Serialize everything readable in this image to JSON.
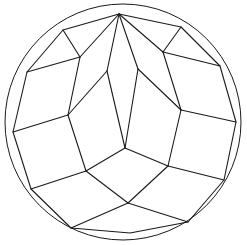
{
  "figure": {
    "stroke_color": "#1a1a1a",
    "background": "#ffffff",
    "circle": {
      "cx": 123,
      "cy": 122,
      "r": 118
    },
    "outer_polygon": [
      [
        119,
        14
      ],
      [
        181,
        27
      ],
      [
        220,
        66
      ],
      [
        236,
        122
      ],
      [
        224,
        180
      ],
      [
        188,
        222
      ],
      [
        130,
        233
      ],
      [
        71,
        228
      ],
      [
        31,
        189
      ],
      [
        13,
        132
      ],
      [
        27,
        72
      ],
      [
        63,
        30
      ]
    ],
    "inner_edges": [
      [
        [
          119,
          14
        ],
        [
          80,
          57
        ]
      ],
      [
        [
          119,
          14
        ],
        [
          107,
          71
        ]
      ],
      [
        [
          119,
          14
        ],
        [
          138,
          69
        ]
      ],
      [
        [
          119,
          14
        ],
        [
          163,
          52
        ]
      ],
      [
        [
          63,
          30
        ],
        [
          80,
          57
        ]
      ],
      [
        [
          181,
          27
        ],
        [
          163,
          52
        ]
      ],
      [
        [
          80,
          57
        ],
        [
          27,
          72
        ]
      ],
      [
        [
          80,
          57
        ],
        [
          68,
          115
        ]
      ],
      [
        [
          107,
          71
        ],
        [
          68,
          115
        ]
      ],
      [
        [
          107,
          71
        ],
        [
          125,
          148
        ]
      ],
      [
        [
          138,
          69
        ],
        [
          125,
          148
        ]
      ],
      [
        [
          138,
          69
        ],
        [
          181,
          110
        ]
      ],
      [
        [
          163,
          52
        ],
        [
          220,
          66
        ]
      ],
      [
        [
          163,
          52
        ],
        [
          181,
          110
        ]
      ],
      [
        [
          181,
          110
        ],
        [
          236,
          122
        ]
      ],
      [
        [
          181,
          110
        ],
        [
          168,
          166
        ]
      ],
      [
        [
          68,
          115
        ],
        [
          13,
          132
        ]
      ],
      [
        [
          68,
          115
        ],
        [
          86,
          171
        ]
      ],
      [
        [
          125,
          148
        ],
        [
          86,
          171
        ]
      ],
      [
        [
          125,
          148
        ],
        [
          168,
          166
        ]
      ],
      [
        [
          86,
          171
        ],
        [
          31,
          189
        ]
      ],
      [
        [
          86,
          171
        ],
        [
          128,
          203
        ]
      ],
      [
        [
          168,
          166
        ],
        [
          224,
          180
        ]
      ],
      [
        [
          168,
          166
        ],
        [
          128,
          203
        ]
      ],
      [
        [
          128,
          203
        ],
        [
          71,
          228
        ]
      ],
      [
        [
          128,
          203
        ],
        [
          188,
          222
        ]
      ]
    ]
  }
}
